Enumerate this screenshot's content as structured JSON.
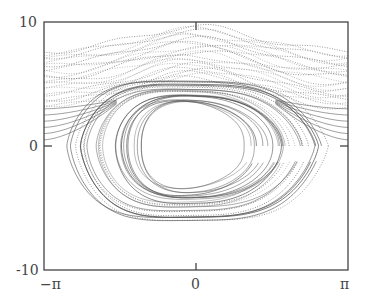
{
  "chart_data": {
    "type": "scatter",
    "title": "",
    "xlabel": "",
    "ylabel": "",
    "xlim": [
      -3.14159,
      3.14159
    ],
    "ylim": [
      -10,
      10
    ],
    "x_ticks": [
      {
        "value": -3.14159,
        "label": "−π"
      },
      {
        "value": 0,
        "label": "0"
      },
      {
        "value": 3.14159,
        "label": "π"
      }
    ],
    "y_ticks": [
      {
        "value": 10,
        "label": "10"
      },
      {
        "value": 0,
        "label": "0"
      },
      {
        "value": -10,
        "label": "-10"
      }
    ],
    "grid": false,
    "legend": null,
    "series": [
      {
        "name": "rotating trajectories",
        "style": "dotted",
        "color": "#777777",
        "momentum_range_at_edges": [
          3.2,
          7.7
        ],
        "momentum_range_at_center": [
          5.5,
          9.6
        ],
        "count": 22
      },
      {
        "name": "librating orbits",
        "style": "solid",
        "color": "#555555",
        "center": [
          0,
          0
        ],
        "inner_half_width_rad": 1.1,
        "outer_half_width_rad": 2.68,
        "max_momentum": 5.2,
        "min_momentum": -6.0,
        "count": 24
      },
      {
        "name": "separatrix-adjacent curves",
        "style": "solid",
        "color": "#666666",
        "momentum_range_at_edges": [
          0.5,
          3.0
        ],
        "count": 6
      }
    ]
  },
  "axes": {
    "x_tick_labels": [
      "−π",
      "0",
      "π"
    ],
    "y_tick_labels": [
      "10",
      "0",
      "-10"
    ]
  }
}
